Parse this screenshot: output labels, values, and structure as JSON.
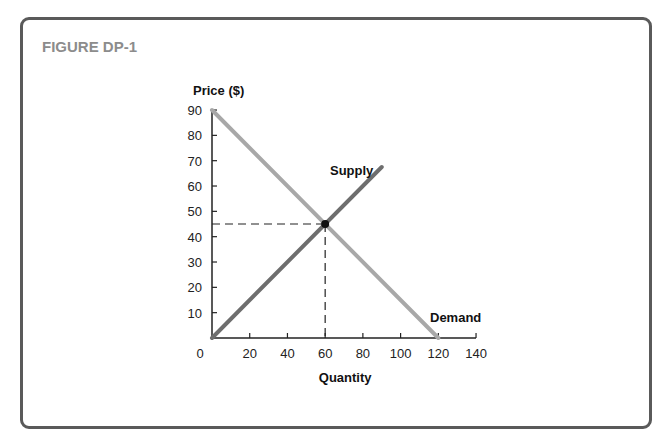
{
  "figure": {
    "title": "FIGURE DP-1"
  },
  "colors": {
    "frame": "#5a5a5a",
    "title": "#8c8c8c",
    "demand": "#a8a8a8",
    "supply": "#6e6e6e",
    "axis": "#222222",
    "point": "#111111"
  },
  "chart_data": {
    "type": "line",
    "title": "FIGURE DP-1",
    "xlabel": "Quantity",
    "ylabel": "Price ($)",
    "xlim": [
      0,
      140
    ],
    "ylim": [
      0,
      90
    ],
    "x_ticks": [
      0,
      20,
      40,
      60,
      80,
      100,
      120,
      140
    ],
    "y_ticks": [
      10,
      20,
      30,
      40,
      50,
      60,
      70,
      80,
      90
    ],
    "grid": false,
    "series": [
      {
        "name": "Supply",
        "points": [
          [
            0,
            0
          ],
          [
            90,
            67.5
          ]
        ]
      },
      {
        "name": "Demand",
        "points": [
          [
            0,
            90
          ],
          [
            120,
            0
          ]
        ]
      }
    ],
    "equilibrium": {
      "x": 60,
      "y": 45
    },
    "annotations": [
      "Supply",
      "Demand"
    ]
  }
}
